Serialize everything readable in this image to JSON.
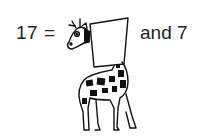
{
  "equation": {
    "left": "17 =",
    "right": "and 7",
    "blank_sign": ""
  },
  "illustration": {
    "subject": "giraffe-holding-blank-sign"
  },
  "colors": {
    "ink": "#222222",
    "background": "#ffffff"
  }
}
